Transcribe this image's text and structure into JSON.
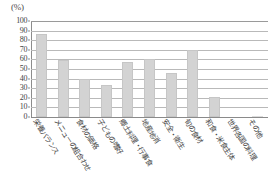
{
  "chart_data": {
    "type": "bar",
    "title": "",
    "subtitle": "",
    "xlabel": "",
    "ylabel": "",
    "unit_label": "(%)",
    "ylim": [
      0,
      100
    ],
    "ytick_step": 10,
    "grid": true,
    "legend": "none",
    "bar_color": "#d3d3d3",
    "bar_border_color": "#c6c6c6",
    "axis_color": "#8d8d8d",
    "gridline_color": "#b9b9b9",
    "ytick_labels": [
      "100",
      "90",
      "80",
      "70",
      "60",
      "50",
      "40",
      "30",
      "20",
      "10",
      "0"
    ],
    "categories": [
      "栄養バランス",
      "メニューの組合わせ",
      "食材の価格",
      "子どもの嗜好",
      "郷土料理・行事食",
      "地産地消",
      "安全・衛生",
      "旬の食材",
      "和食・米食主体",
      "世界各国の料理",
      "その他"
    ],
    "values": [
      86,
      59,
      40,
      33,
      57,
      60,
      46,
      70,
      21,
      0,
      1
    ]
  }
}
